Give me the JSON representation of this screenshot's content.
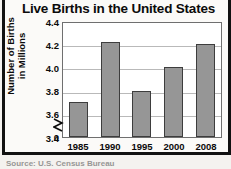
{
  "figure": {
    "source_note": "Source: U.S. Census Bureau"
  },
  "chart_data": {
    "type": "bar",
    "title": "Live Births in the United States",
    "xlabel": "",
    "ylabel": "Number of Births in Millions",
    "ylabel_lines": [
      "Number of Births",
      "in Millions"
    ],
    "categories": [
      "1985",
      "1990",
      "1995",
      "2000",
      "2008"
    ],
    "values": [
      3.7,
      4.22,
      3.8,
      4.0,
      4.2
    ],
    "ytick_labels": [
      "4.4",
      "4.2",
      "4.0",
      "3.8",
      "3.6",
      "3.4",
      "0"
    ],
    "ytick_values": [
      4.4,
      4.2,
      4.0,
      3.8,
      3.6,
      3.4,
      0
    ],
    "ylim": [
      3.4,
      4.4
    ],
    "axis_break": true,
    "axis_break_between": [
      0,
      3.4
    ],
    "grid": true,
    "grid_axis": "y",
    "legend": "none",
    "bar_color": "#969696",
    "bar_edge_color": "#3d3d3d",
    "plot_background": "#ffffff",
    "frame_color": "#111111"
  }
}
